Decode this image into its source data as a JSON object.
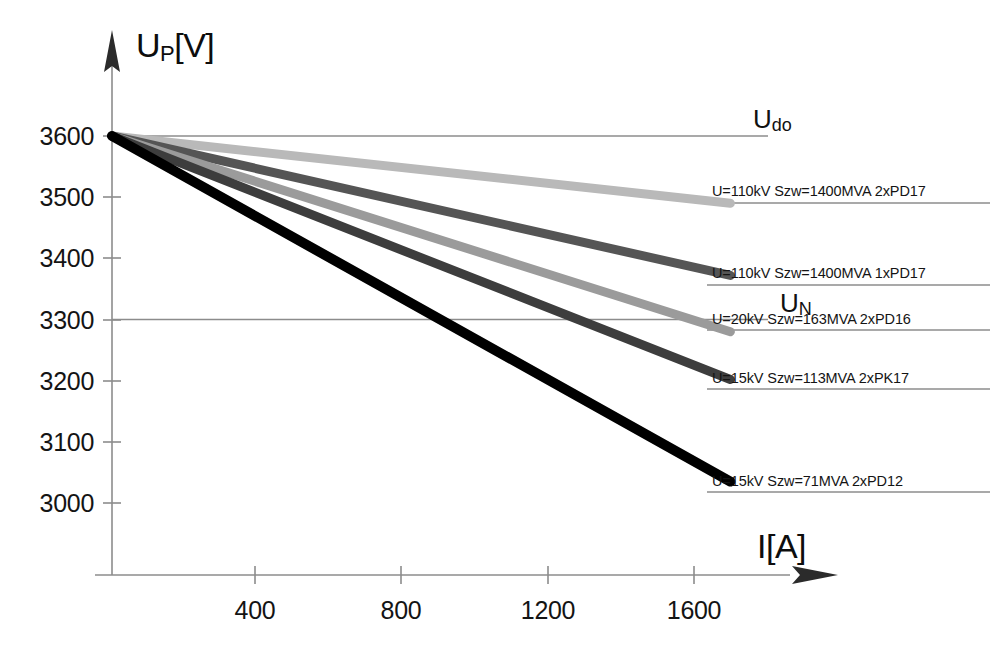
{
  "chart_data": {
    "type": "line",
    "title": "",
    "xlabel": "I[A]",
    "ylabel": "U_P[V]",
    "xlim": [
      0,
      1900
    ],
    "ylim": [
      2960,
      3660
    ],
    "xticks": [
      400,
      800,
      1200,
      1600
    ],
    "yticks": [
      3000,
      3100,
      3200,
      3300,
      3400,
      3500,
      3600
    ],
    "grid": false,
    "legend_position": "right-inline",
    "x": [
      0,
      1700
    ],
    "series": [
      {
        "name": "U=110kV Szw=1400MVA 2xPD17",
        "values": [
          3600,
          3490
        ],
        "color": "#b9b9b9",
        "label_y": 3492
      },
      {
        "name": "U=110kV Szw=1400MVA 1xPD17",
        "values": [
          3600,
          3372
        ],
        "color": "#555555",
        "label_y": 3374
      },
      {
        "name": "U=20kV Szw=163MVA 2xPD16",
        "values": [
          3600,
          3280
        ],
        "color": "#9b9b9b",
        "label_y": 3282
      },
      {
        "name": "U=15kV Szw=113MVA 2xPK17",
        "values": [
          3600,
          3202
        ],
        "color": "#3d3d3d",
        "label_y": 3204
      },
      {
        "name": "U=15kV Szw=71MVA 2xPD12",
        "values": [
          3600,
          3035
        ],
        "color": "#000000",
        "label_y": 3037
      }
    ],
    "reference_lines": [
      {
        "name": "Udo",
        "label": "U",
        "sub": "do",
        "value": 3600,
        "color": "#8c8c8c"
      },
      {
        "name": "UN",
        "label": "U",
        "sub": "N",
        "value": 3300,
        "color": "#8c8c8c"
      }
    ],
    "axis_color": "#8c8c8c",
    "tick_labels_x": [
      "400",
      "800",
      "1200",
      "1600"
    ],
    "tick_labels_y": [
      "3000",
      "3100",
      "3200",
      "3300",
      "3400",
      "3500",
      "3600"
    ]
  },
  "axis": {
    "y_title_main": "U",
    "y_title_sub": "P",
    "y_title_unit": "[V]",
    "x_title": "I[A]"
  },
  "reference": {
    "udo_main": "U",
    "udo_sub": "do",
    "un_main": "U",
    "un_sub": "N"
  },
  "series_labels": [
    "U=110kV Szw=1400MVA 2xPD17",
    "U=110kV Szw=1400MVA 1xPD17",
    "U=20kV Szw=163MVA 2xPD16",
    "U=15kV Szw=113MVA 2xPK17",
    "U=15kV Szw=71MVA 2xPD12"
  ],
  "y_tick_labels": [
    "3600",
    "3500",
    "3400",
    "3300",
    "3200",
    "3100",
    "3000"
  ],
  "x_tick_labels": [
    "400",
    "800",
    "1200",
    "1600"
  ]
}
